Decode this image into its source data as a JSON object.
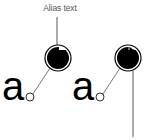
{
  "diagram": {
    "title_label": "Alias text",
    "glyph": "a",
    "samples": [
      {
        "name": "aliased",
        "glyph": "a"
      },
      {
        "name": "anti-aliased",
        "glyph": "a"
      }
    ],
    "colors": {
      "ink": "#000000",
      "leader_line": "#555555",
      "label": "#555555",
      "background": "#ffffff"
    }
  }
}
